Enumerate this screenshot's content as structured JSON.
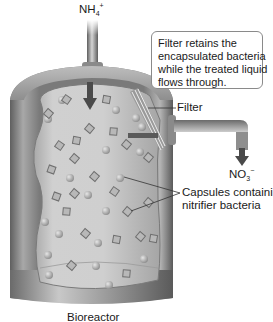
{
  "diagram": {
    "title": "Bioreactor",
    "inlet": {
      "species": "NH",
      "subscript": "4",
      "superscript": "+"
    },
    "outlet": {
      "species": "NO",
      "subscript": "3",
      "superscript": "−"
    },
    "callout": {
      "lines": [
        "Filter retains the",
        "encapsulated bacteria",
        "while the treated liquid",
        "flows through."
      ]
    },
    "labels": {
      "filter": "Filter",
      "capsules_line1": "Capsules containing",
      "capsules_line2": "nitrifier bacteria"
    },
    "colors": {
      "vessel_dark": "#6b6b6b",
      "vessel_mid": "#9a9a9a",
      "vessel_light": "#d9d9d9",
      "liquid": "#c4c4c4",
      "text": "#1a1a1a",
      "arrow": "#4a4a4a"
    }
  }
}
